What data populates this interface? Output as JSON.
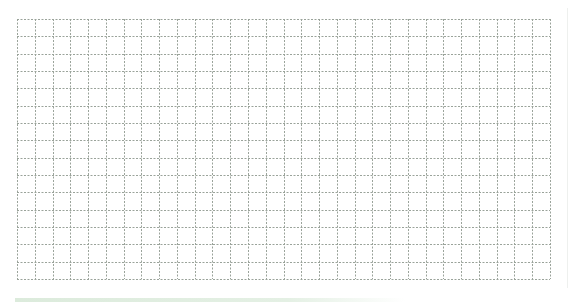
{
  "grid": {
    "columns": 30,
    "rows": 15,
    "line_color": "#9aa39a",
    "line_style": "dashed",
    "background": "#ffffff"
  },
  "colors": {
    "bottom_bar": "#dcebdc",
    "right_edge": "#eef0ee"
  }
}
